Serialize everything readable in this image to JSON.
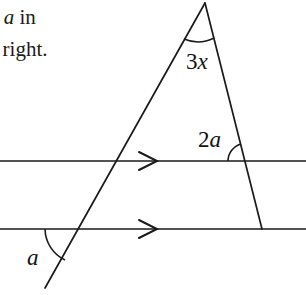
{
  "figure": {
    "caption_text": {
      "line_1_prefix": "– ",
      "line_1_var": "a",
      "line_1_suffix": " in",
      "line_2": "e right."
    },
    "labels": {
      "apex_angle": {
        "coefficient": "3",
        "variable": "x"
      },
      "upper_angle": {
        "coefficient": "2",
        "variable": "a"
      },
      "lower_angle": {
        "coefficient": "",
        "variable": "a"
      }
    },
    "stroke_color": "#1a1a1a",
    "background_color": "#ffffff",
    "line_width": 1.6,
    "geometry": {
      "apex": {
        "x": 205,
        "y": 3
      },
      "transversal_left": {
        "x1": 205,
        "y1": 3,
        "x2": 45,
        "y2": 288
      },
      "transversal_right": {
        "x1": 205,
        "y1": 3,
        "x2": 262,
        "y2": 229
      },
      "parallel_line_upper": {
        "x1": 0,
        "y1": 161,
        "x2": 306,
        "y2": 161
      },
      "parallel_line_lower": {
        "x1": 0,
        "y1": 229,
        "x2": 306,
        "y2": 229
      },
      "arrow_marker_x": 150,
      "arrow_marker_shape": "single-chevron-right",
      "intersections": {
        "left_upper": {
          "x": 118,
          "y": 161
        },
        "left_lower": {
          "x": 80,
          "y": 229
        },
        "right_upper": {
          "x": 246,
          "y": 161
        },
        "right_lower": {
          "x": 262,
          "y": 229
        }
      },
      "arcs": {
        "apex_arc_radius": 36,
        "upper_arc_radius": 18,
        "lower_arc_radius": 35
      }
    }
  }
}
